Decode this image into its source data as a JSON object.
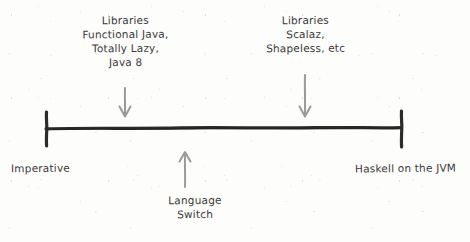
{
  "diagram": {
    "type": "spectrum-scale",
    "title": "",
    "axis": {
      "orientation": "horizontal",
      "x_start": 45,
      "x_end": 402,
      "y": 128,
      "stroke_color": "#2b2b2b",
      "endpoint_style": "vertical-tick",
      "left_endpoint_label": "Imperative",
      "right_endpoint_label": "Haskell on the JVM"
    },
    "annotations": [
      {
        "id": "left-libraries",
        "lines": [
          "Libraries",
          "Functional Java,",
          "Totally Lazy,",
          "Java 8"
        ],
        "arrow": {
          "direction": "down",
          "x": 125,
          "y_start": 88,
          "y_end": 116,
          "color": "#9a9a9a"
        }
      },
      {
        "id": "right-libraries",
        "lines": [
          "Libraries",
          "Scalaz,",
          "Shapeless, etc"
        ],
        "arrow": {
          "direction": "down",
          "x": 305,
          "y_start": 75,
          "y_end": 116,
          "color": "#9a9a9a"
        }
      },
      {
        "id": "language-switch",
        "lines": [
          "Language",
          "Switch"
        ],
        "arrow": {
          "direction": "up",
          "x": 185,
          "y_start": 187,
          "y_end": 152,
          "color": "#9a9a9a"
        }
      }
    ],
    "colors": {
      "background": "#fdfdfc",
      "ink": "#2b2b2b",
      "text": "#3a3a3a",
      "arrow": "#9a9a9a"
    }
  }
}
